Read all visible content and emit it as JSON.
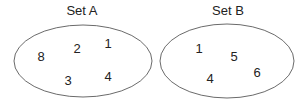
{
  "diagram": {
    "type": "set-diagram",
    "sets": [
      {
        "label": "Set A",
        "elements": [
          "8",
          "2",
          "1",
          "3",
          "4"
        ]
      },
      {
        "label": "Set B",
        "elements": [
          "1",
          "5",
          "6",
          "4"
        ]
      }
    ],
    "colors": {
      "stroke": "#444444",
      "text": "#222222",
      "background": "#ffffff"
    }
  }
}
